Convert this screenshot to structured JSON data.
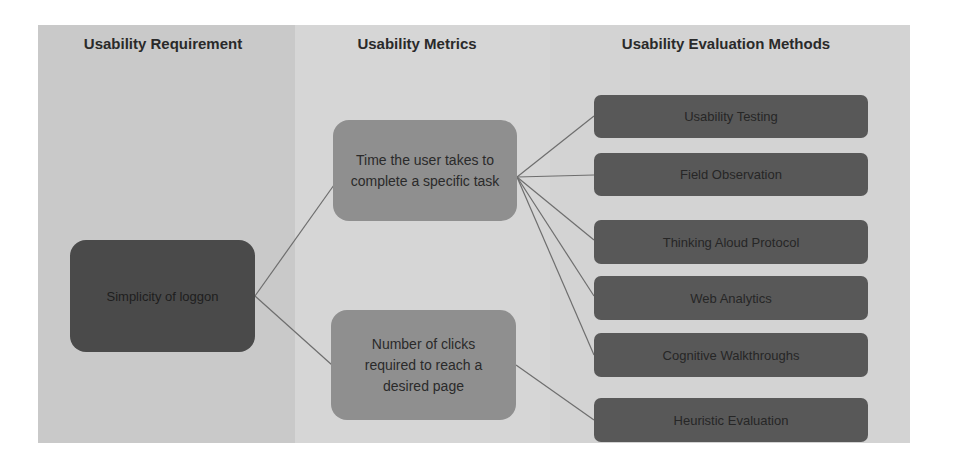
{
  "diagram": {
    "columns": [
      {
        "id": "requirement",
        "header": "Usability Requirement"
      },
      {
        "id": "metrics",
        "header": "Usability Metrics"
      },
      {
        "id": "methods",
        "header": "Usability Evaluation Methods"
      }
    ],
    "requirement": {
      "label": "Simplicity of loggon"
    },
    "metrics": [
      {
        "label": "Time the user takes to complete a specific task"
      },
      {
        "label": "Number of clicks required to reach a desired page"
      }
    ],
    "methods": [
      {
        "label": "Usability Testing"
      },
      {
        "label": "Field Observation"
      },
      {
        "label": "Thinking Aloud Protocol"
      },
      {
        "label": "Web Analytics"
      },
      {
        "label": "Cognitive Walkthroughs"
      },
      {
        "label": "Heuristic Evaluation"
      }
    ],
    "edges": [
      {
        "from": "requirement",
        "to": "metrics.0"
      },
      {
        "from": "requirement",
        "to": "metrics.1"
      },
      {
        "from": "metrics.0",
        "to": "methods.0"
      },
      {
        "from": "metrics.0",
        "to": "methods.1"
      },
      {
        "from": "metrics.0",
        "to": "methods.2"
      },
      {
        "from": "metrics.0",
        "to": "methods.3"
      },
      {
        "from": "metrics.0",
        "to": "methods.4"
      },
      {
        "from": "metrics.1",
        "to": "methods.5"
      }
    ],
    "colors": {
      "requirement_column": "#c9c9c9",
      "metrics_column": "#d6d6d6",
      "methods_column": "#d3d3d3",
      "requirement_node": "#4a4a4a",
      "metric_node": "#8f8f8f",
      "method_node": "#585858",
      "connector": "#6e6e6e"
    }
  }
}
